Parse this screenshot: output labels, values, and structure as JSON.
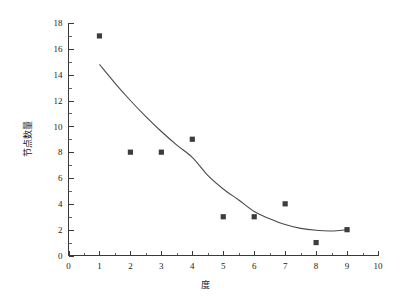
{
  "chart_data": {
    "type": "scatter",
    "title": "",
    "subtitle": "",
    "xlabel": "度",
    "ylabel": "节点数量",
    "xlim": [
      0,
      10
    ],
    "ylim": [
      0,
      18
    ],
    "grid": false,
    "legend": false,
    "legend_position": "none",
    "x_tick_labels": [
      "0",
      "1",
      "2",
      "3",
      "4",
      "5",
      "6",
      "7",
      "8",
      "9",
      "10"
    ],
    "y_tick_labels": [
      "0",
      "2",
      "4",
      "6",
      "8",
      "10",
      "12",
      "14",
      "16",
      "18"
    ],
    "x_major_step": 1,
    "x_minor_step": 0.5,
    "y_major_step": 2,
    "y_minor_step": 1,
    "marker_color": "#3d3d3d",
    "curve_color": "#4a4a4a",
    "axis_color": "#3a3a3a",
    "series": [
      {
        "name": "观测值",
        "type": "scatter",
        "marker": "square",
        "x": [
          1,
          2,
          3,
          4,
          5,
          6,
          7,
          8,
          9
        ],
        "values": [
          17,
          8,
          8,
          9,
          3,
          3,
          4,
          1,
          2
        ]
      },
      {
        "name": "拟合曲线",
        "type": "line",
        "x": [
          1.0,
          1.5,
          2.0,
          2.5,
          3.0,
          3.5,
          4.0,
          4.5,
          5.0,
          5.5,
          6.0,
          6.5,
          7.0,
          7.5,
          8.0,
          8.5,
          9.0
        ],
        "values": [
          14.8,
          13.35,
          12.0,
          10.75,
          9.6,
          8.55,
          7.6,
          6.2,
          5.15,
          4.3,
          3.4,
          2.85,
          2.4,
          2.1,
          1.95,
          1.9,
          2.0
        ]
      }
    ]
  },
  "axis": {
    "x_title": "度",
    "y_title": "节点数量"
  }
}
